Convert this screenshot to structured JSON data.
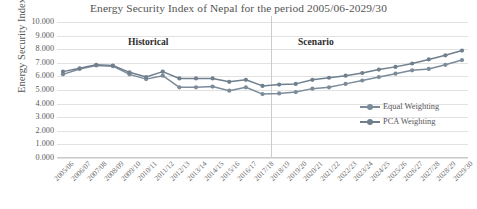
{
  "chart_data": {
    "type": "line",
    "title": "Energy Security Index of Nepal for the period 2005/06-2029/30",
    "xlabel": "",
    "ylabel": "Energy Security Index",
    "ylim": [
      0,
      10
    ],
    "ytick_step": 1,
    "grid": true,
    "legend_position": "right-inside",
    "categories": [
      "2005/06",
      "2006/07",
      "2007/08",
      "2008/09",
      "2009/10",
      "2010/11",
      "2011/12",
      "2012/13",
      "2013/14",
      "2014/15",
      "2015/16",
      "2016/17",
      "2017/18",
      "2018/19",
      "2019/20",
      "2020/21",
      "2021/22",
      "2022/23",
      "2023/24",
      "2024/25",
      "2025/26",
      "2026/27",
      "2027/28",
      "2028/29",
      "2029/30"
    ],
    "ytick_labels": [
      "10.000",
      "9.000",
      "8.000",
      "7.000",
      "6.000",
      "5.000",
      "4.000",
      "3.000",
      "2.000",
      "1.000",
      "0.000"
    ],
    "series": [
      {
        "name": "Equal Weighting",
        "color": "#7c8b99",
        "values": [
          6.15,
          6.55,
          6.8,
          6.75,
          6.15,
          5.8,
          6.05,
          5.2,
          5.2,
          5.25,
          4.95,
          5.2,
          4.7,
          4.75,
          4.85,
          5.1,
          5.2,
          5.45,
          5.7,
          5.95,
          6.2,
          6.45,
          6.55,
          6.85,
          7.2
        ]
      },
      {
        "name": "PCA Weighting",
        "color": "#6f7f8d",
        "values": [
          6.35,
          6.6,
          6.85,
          6.8,
          6.3,
          5.95,
          6.35,
          5.85,
          5.85,
          5.85,
          5.6,
          5.75,
          5.3,
          5.4,
          5.45,
          5.75,
          5.9,
          6.05,
          6.25,
          6.5,
          6.7,
          6.95,
          7.25,
          7.55,
          7.9
        ]
      }
    ],
    "annotations": [
      {
        "id": "historical",
        "text": "Historical"
      },
      {
        "id": "scenario",
        "text": "Scenario"
      }
    ],
    "divider": {
      "after_category": "2016/17",
      "index": 12
    }
  }
}
